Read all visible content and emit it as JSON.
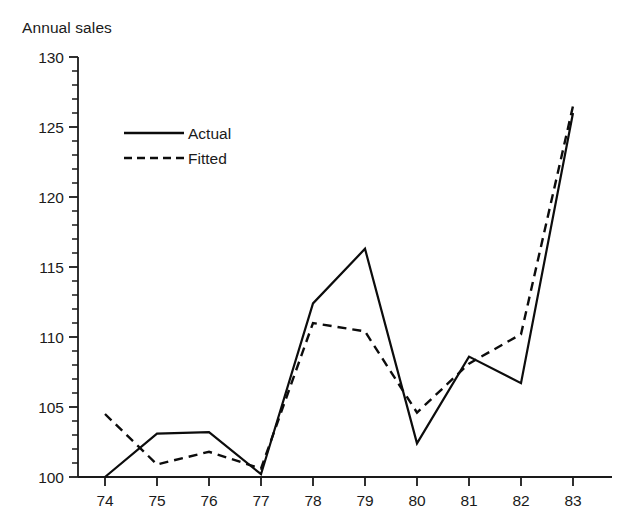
{
  "chart_data": {
    "type": "line",
    "title": "Annual sales",
    "xlabel": "",
    "ylabel": "Annual sales",
    "categories": [
      "74",
      "75",
      "76",
      "77",
      "78",
      "79",
      "80",
      "81",
      "82",
      "83"
    ],
    "x": [
      74,
      75,
      76,
      77,
      78,
      79,
      80,
      81,
      82,
      83
    ],
    "series": [
      {
        "name": "Actual",
        "style": "solid",
        "values": [
          100.0,
          103.1,
          103.2,
          100.2,
          112.4,
          116.3,
          102.4,
          108.6,
          106.7,
          126.0
        ]
      },
      {
        "name": "Fitted",
        "style": "dashed",
        "values": [
          104.5,
          100.9,
          101.8,
          100.6,
          111.0,
          110.4,
          104.6,
          108.1,
          110.2,
          126.5
        ]
      }
    ],
    "ylim": [
      100,
      130
    ],
    "ytick_labels": [
      "130",
      "125",
      "120",
      "115",
      "110",
      "105",
      "100"
    ],
    "ytick_values": [
      130,
      125,
      120,
      115,
      110,
      105,
      100
    ],
    "ytick_minor_step": 1,
    "xtick_labels": [
      "74",
      "75",
      "76",
      "77",
      "78",
      "79",
      "80",
      "81",
      "82",
      "83"
    ],
    "grid": false,
    "legend_position": "upper-left-inside",
    "legend_entries": [
      {
        "label": "Actual",
        "style": "solid"
      },
      {
        "label": "Fitted",
        "style": "dashed"
      }
    ],
    "line_color": "#0c0c0c",
    "axis_color": "#1a1a1a",
    "background": "#ffffff"
  }
}
